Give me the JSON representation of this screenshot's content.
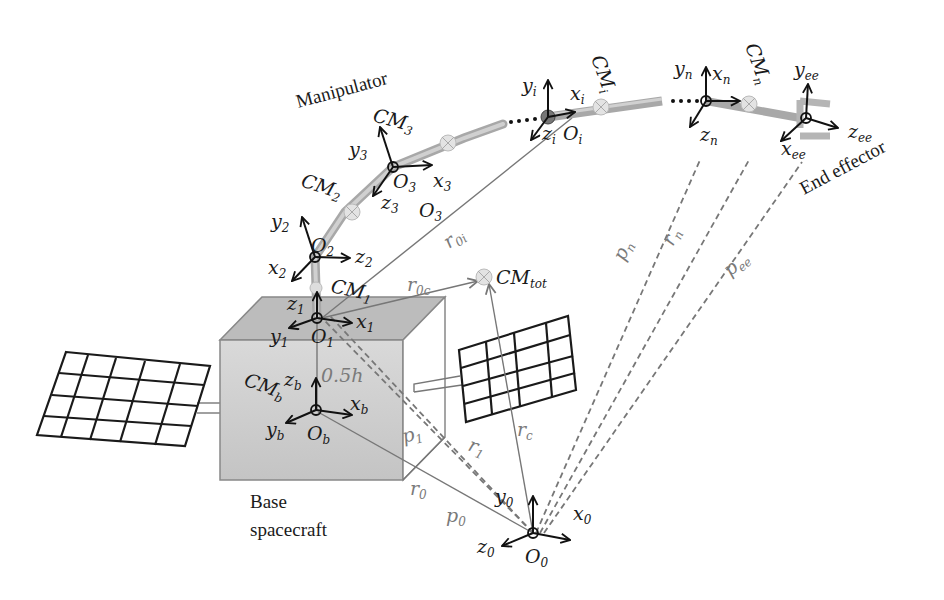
{
  "diagram": {
    "type": "space-manipulator-kinematics",
    "labels": {
      "manipulator": "Manipulator",
      "end_effector": "End effector",
      "base_line1": "Base",
      "base_line2": "spacecraft",
      "half_height": "0.5h"
    },
    "frames": {
      "inertial": {
        "origin": "O",
        "origin_sub": "0",
        "x": "x",
        "x_sub": "0",
        "y": "y",
        "y_sub": "0",
        "z": "z",
        "z_sub": "0"
      },
      "base": {
        "origin": "O",
        "origin_sub": "b",
        "x": "x",
        "x_sub": "b",
        "y": "y",
        "y_sub": "b",
        "z": "z",
        "z_sub": "b"
      },
      "joint1": {
        "origin": "O",
        "origin_sub": "1",
        "x": "x",
        "x_sub": "1",
        "y": "y",
        "y_sub": "1",
        "z": "z",
        "z_sub": "1"
      },
      "joint2": {
        "origin": "O",
        "origin_sub": "2",
        "x": "x",
        "x_sub": "2",
        "y": "y",
        "y_sub": "2",
        "z": "z",
        "z_sub": "2"
      },
      "joint3": {
        "origin": "O",
        "origin_sub": "3",
        "x": "x",
        "x_sub": "3",
        "y": "y",
        "y_sub": "3",
        "z": "z",
        "z_sub": "3",
        "extra_origin": "O",
        "extra_origin_sub": "3"
      },
      "joint_i": {
        "origin": "O",
        "origin_sub": "i",
        "x": "x",
        "x_sub": "i",
        "y": "y",
        "y_sub": "i",
        "z": "z",
        "z_sub": "i"
      },
      "joint_n": {
        "x": "x",
        "x_sub": "n",
        "y": "y",
        "y_sub": "n",
        "z": "z",
        "z_sub": "n"
      },
      "end_effector": {
        "x": "x",
        "x_sub": "ee",
        "y": "y",
        "y_sub": "ee",
        "z": "z",
        "z_sub": "ee"
      }
    },
    "centers_of_mass": {
      "cm_b": {
        "main": "CM",
        "sub": "b"
      },
      "cm_1": {
        "main": "CM",
        "sub": "1"
      },
      "cm_2": {
        "main": "CM",
        "sub": "2"
      },
      "cm_3": {
        "main": "CM",
        "sub": "3"
      },
      "cm_i": {
        "main": "CM",
        "sub": "i"
      },
      "cm_n": {
        "main": "CM",
        "sub": "n"
      },
      "cm_tot": {
        "main": "CM",
        "sub": "tot"
      }
    },
    "vectors": {
      "r0": {
        "main": "r",
        "sub": "0"
      },
      "p0": {
        "main": "p",
        "sub": "0"
      },
      "r1": {
        "main": "r",
        "sub": "1"
      },
      "p1": {
        "main": "p",
        "sub": "1"
      },
      "rc": {
        "main": "r",
        "sub": "c"
      },
      "r0c": {
        "main": "r",
        "sub": "0c"
      },
      "r0i": {
        "main": "r",
        "sub": "0i"
      },
      "pn": {
        "main": "p",
        "sub": "n"
      },
      "rn": {
        "main": "r",
        "sub": "n"
      },
      "pee": {
        "main": "p",
        "sub": "ee"
      }
    },
    "colors": {
      "link": "#b8b8b8",
      "box_front": "#cfcfcf",
      "box_top": "#bdbdbd",
      "axis": "#111111",
      "vector": "#777777"
    }
  }
}
